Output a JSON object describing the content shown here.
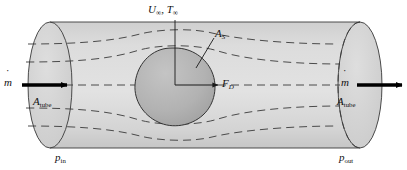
{
  "figure": {
    "background_color": "#ffffff",
    "tube_fill": "#d6d6d6",
    "tube_fill_light": "#dedede",
    "body_fill": "#b0b0b0",
    "line_color": "#2b2b2b",
    "arrow_color": "#000000"
  },
  "labels": {
    "freestream": {
      "symbol_u": "U",
      "sub_u": "∞",
      "separator": ", ",
      "symbol_t": "T",
      "sub_t": "∞",
      "text": "U∞, T∞"
    },
    "surface_area": {
      "symbol": "A",
      "sub": "S",
      "text": "AS"
    },
    "drag_force": {
      "symbol": "F",
      "sub": "D",
      "text": "FD"
    },
    "mass_flow_in": {
      "symbol": "m",
      "accent": "dot",
      "text": "ṁ"
    },
    "mass_flow_out": {
      "symbol": "m",
      "accent": "dot",
      "text": "ṁ"
    },
    "area_tube_in": {
      "symbol": "A",
      "sub": "tube",
      "text": "Atube"
    },
    "area_tube_out": {
      "symbol": "A",
      "sub": "tube",
      "text": "Atube"
    },
    "pressure_in": {
      "symbol": "p",
      "sub": "in",
      "text": "pin"
    },
    "pressure_out": {
      "symbol": "p",
      "sub": "out",
      "text": "pout"
    }
  },
  "geometry": {
    "tube_left_center_x": 50,
    "tube_right_center_x": 360,
    "tube_top_y": 22,
    "tube_bottom_y": 148,
    "ellipse_rx": 22,
    "ellipse_ry": 63,
    "center_y": 85,
    "body_center_x": 175,
    "body_center_y": 88,
    "streamline_count": 6
  },
  "elements": {
    "inlet_arrow": "arrow-right",
    "outlet_arrow": "arrow-right",
    "drag_arrow": "arrow-right",
    "leader_line_as": "leader-line",
    "axis_vertical": "center-axis-line",
    "streamlines_style": "dashed"
  }
}
